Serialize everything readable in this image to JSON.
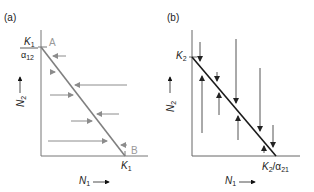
{
  "panel_a": {
    "label": "(a)",
    "y_label_top": "K",
    "y_label_top_sub": "1",
    "y_label_bottom": "α",
    "y_label_bottom_sub": "12",
    "point_a": "A",
    "point_b": "B",
    "x_label": "K",
    "x_label_sub": "1",
    "y_axis_title": "N",
    "y_axis_title_sub": "2",
    "x_axis_title": "N",
    "x_axis_title_sub": "1",
    "line_color": "#808080",
    "arrow_color": "#8c8c8c"
  },
  "panel_b": {
    "label": "(b)",
    "y_label": "K",
    "y_label_sub": "2",
    "x_label": "K",
    "x_label_sub": "2",
    "x_label_div": "/α",
    "x_label_div_sub": "21",
    "y_axis_title": "N",
    "y_axis_title_sub": "2",
    "x_axis_title": "N",
    "x_axis_title_sub": "1",
    "line_color": "#1a1a1a",
    "arrow_color": "#555555"
  }
}
